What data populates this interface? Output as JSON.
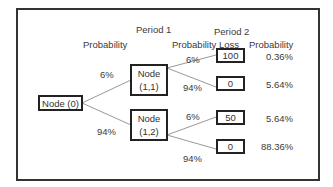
{
  "headers": {
    "period1": "Period 1",
    "period2": "Period 2",
    "probability1": "Probability",
    "probability2": "Probability",
    "loss": "Loss",
    "probability3": "Probability"
  },
  "nodes": {
    "root": "Node (0)",
    "n11_line1": "Node",
    "n11_line2": "(1,1)",
    "n12_line1": "Node",
    "n12_line2": "(1,2)"
  },
  "branch_probs": {
    "root_to_n11": "6%",
    "root_to_n12": "94%",
    "n11_to_l1": "6%",
    "n11_to_l2": "94%",
    "n12_to_l3": "6%",
    "n12_to_l4": "94%"
  },
  "leaves": [
    {
      "loss": "100",
      "probability": "0.36%"
    },
    {
      "loss": "0",
      "probability": "5.64%"
    },
    {
      "loss": "50",
      "probability": "5.64%"
    },
    {
      "loss": "0",
      "probability": "88.36%"
    }
  ],
  "colors": {
    "border": "#222222",
    "line": "#999999",
    "text": "#333333"
  }
}
